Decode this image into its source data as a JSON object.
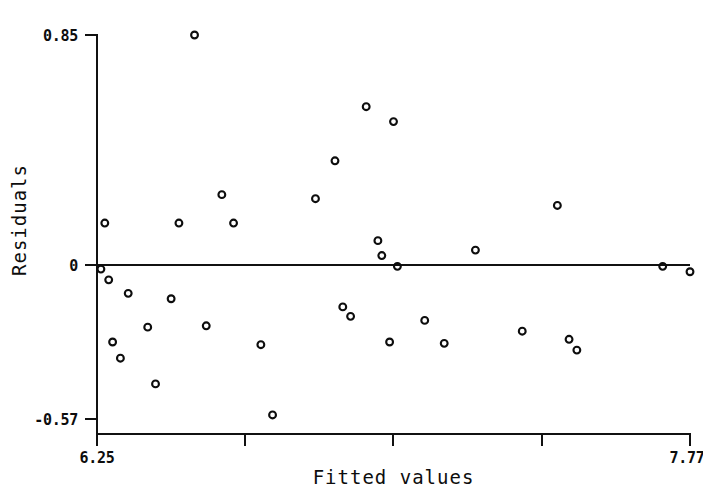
{
  "chart_data": {
    "type": "scatter",
    "title": "",
    "xlabel": "Fitted values",
    "ylabel": "Residuals",
    "xlim": [
      6.25,
      7.77
    ],
    "ylim": [
      -0.57,
      0.85
    ],
    "grid": false,
    "legend": null,
    "x_tick_labels": [
      "6.25",
      "7.77"
    ],
    "y_tick_labels": [
      "0.85",
      "0",
      "-0.57"
    ],
    "x_ticks_unlabeled_count": 3,
    "annotations": [
      {
        "kind": "reference-line",
        "axis": "y",
        "value": 0,
        "label": "zero residual line"
      }
    ],
    "marker": {
      "shape": "open-circle",
      "size": 5,
      "color": "#0d0d0d",
      "fill": "none"
    },
    "points": [
      {
        "x": 6.26,
        "y": -0.015
      },
      {
        "x": 6.27,
        "y": 0.155
      },
      {
        "x": 6.28,
        "y": -0.055
      },
      {
        "x": 6.29,
        "y": -0.285
      },
      {
        "x": 6.31,
        "y": -0.345
      },
      {
        "x": 6.33,
        "y": -0.105
      },
      {
        "x": 6.38,
        "y": -0.23
      },
      {
        "x": 6.4,
        "y": -0.44
      },
      {
        "x": 6.44,
        "y": -0.125
      },
      {
        "x": 6.46,
        "y": 0.155
      },
      {
        "x": 6.5,
        "y": 0.85
      },
      {
        "x": 6.53,
        "y": -0.225
      },
      {
        "x": 6.57,
        "y": 0.26
      },
      {
        "x": 6.6,
        "y": 0.155
      },
      {
        "x": 6.67,
        "y": -0.295
      },
      {
        "x": 6.7,
        "y": -0.555
      },
      {
        "x": 6.81,
        "y": 0.245
      },
      {
        "x": 6.86,
        "y": 0.385
      },
      {
        "x": 6.88,
        "y": -0.155
      },
      {
        "x": 6.9,
        "y": -0.19
      },
      {
        "x": 6.94,
        "y": 0.585
      },
      {
        "x": 6.97,
        "y": 0.09
      },
      {
        "x": 6.98,
        "y": 0.035
      },
      {
        "x": 7.0,
        "y": -0.285
      },
      {
        "x": 7.01,
        "y": 0.53
      },
      {
        "x": 7.02,
        "y": -0.005
      },
      {
        "x": 7.09,
        "y": -0.205
      },
      {
        "x": 7.14,
        "y": -0.29
      },
      {
        "x": 7.22,
        "y": 0.055
      },
      {
        "x": 7.34,
        "y": -0.245
      },
      {
        "x": 7.43,
        "y": 0.22
      },
      {
        "x": 7.46,
        "y": -0.275
      },
      {
        "x": 7.48,
        "y": -0.315
      },
      {
        "x": 7.7,
        "y": -0.005
      },
      {
        "x": 7.77,
        "y": -0.025
      }
    ]
  },
  "axes": {
    "y_top_label": "0.85",
    "y_mid_label": "0",
    "y_bottom_label": "-0.57",
    "x_left_label": "6.25",
    "x_right_label": "7.77",
    "x_title": "Fitted values",
    "y_title": "Residuals"
  },
  "colors": {
    "ink": "#0d0d0d",
    "background": "#ffffff"
  }
}
